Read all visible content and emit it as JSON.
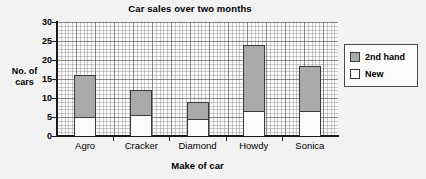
{
  "chart_data": {
    "type": "bar",
    "subtype": "stacked",
    "title": "Car sales over two months",
    "xlabel": "Make of car",
    "ylabel": "No. of cars",
    "categories": [
      "Agro",
      "Cracker",
      "Diamond",
      "Howdy",
      "Sonica"
    ],
    "series": [
      {
        "name": "New",
        "color": "#ffffff",
        "values": [
          5,
          5.5,
          4.5,
          6.5,
          6.5
        ]
      },
      {
        "name": "2nd hand",
        "color": "#aaaaaa",
        "values": [
          11,
          6.5,
          4.5,
          17.5,
          12
        ]
      }
    ],
    "totals": [
      16,
      12,
      9,
      24,
      18.5
    ],
    "ylim": [
      0,
      30
    ],
    "yticks": [
      0,
      5,
      10,
      15,
      20,
      25,
      30
    ],
    "ytick_labels": [
      "0",
      "5",
      "10",
      "15",
      "20",
      "25",
      "30"
    ],
    "grid": true,
    "minor_grid": true,
    "legend_position": "right",
    "legend_entries": [
      {
        "label": "2nd hand",
        "color": "#aaaaaa"
      },
      {
        "label": "New",
        "color": "#ffffff"
      }
    ]
  },
  "ylabel_lines": {
    "line1": "No. of",
    "line2": "cars"
  }
}
